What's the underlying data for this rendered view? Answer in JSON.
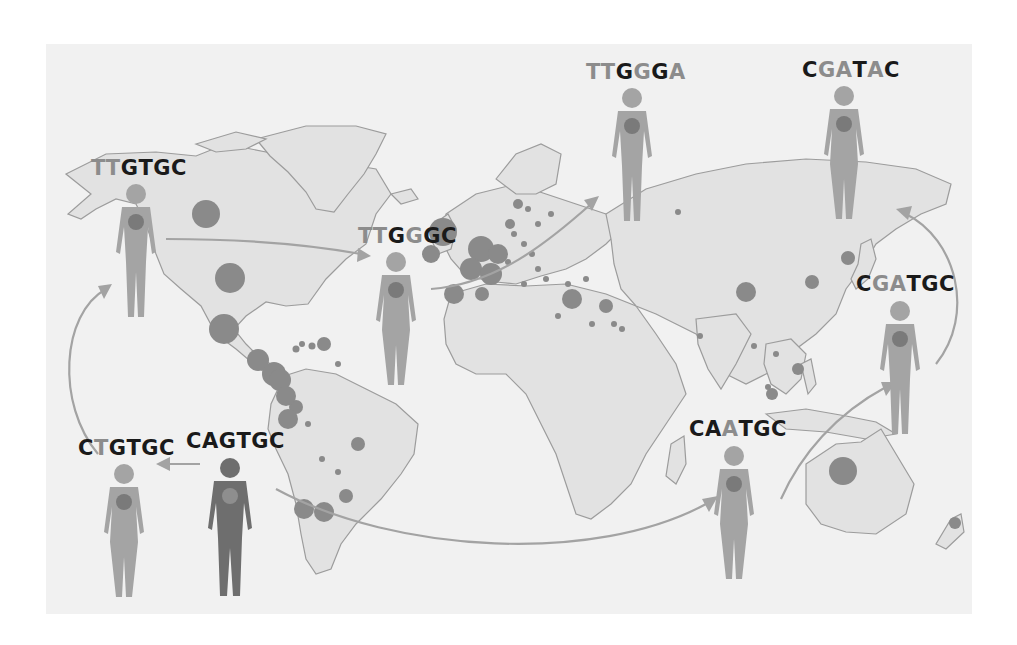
{
  "figure": {
    "title": "",
    "colors": {
      "background": "#f1f1f1",
      "land": "#e2e2e2",
      "land_border": "#9c9c9c",
      "case_dot": "#8a8a8a",
      "arrow": "#a3a3a3",
      "base_unchanged": "#1a1a1a",
      "base_mutated": "#8c8c8c",
      "person_origin": "#6e6e6e",
      "person_infected": "#a4a4a4"
    }
  },
  "people": [
    {
      "id": "origin",
      "sequence": "CAGTGC",
      "bases": [
        {
          "b": "C",
          "mutated": false
        },
        {
          "b": "A",
          "mutated": false
        },
        {
          "b": "G",
          "mutated": false
        },
        {
          "b": "T",
          "mutated": false
        },
        {
          "b": "G",
          "mutated": false
        },
        {
          "b": "C",
          "mutated": false
        }
      ],
      "figure": "male-dark",
      "region": "South America (south-west)"
    },
    {
      "id": "p1",
      "sequence": "CTGTGC",
      "bases": [
        {
          "b": "C",
          "mutated": false
        },
        {
          "b": "T",
          "mutated": true
        },
        {
          "b": "G",
          "mutated": false
        },
        {
          "b": "T",
          "mutated": false
        },
        {
          "b": "G",
          "mutated": false
        },
        {
          "b": "C",
          "mutated": false
        }
      ],
      "figure": "female",
      "region": "Pacific (west of South America)"
    },
    {
      "id": "p2",
      "sequence": "TTGTGC",
      "bases": [
        {
          "b": "T",
          "mutated": true
        },
        {
          "b": "T",
          "mutated": true
        },
        {
          "b": "G",
          "mutated": false
        },
        {
          "b": "T",
          "mutated": false
        },
        {
          "b": "G",
          "mutated": false
        },
        {
          "b": "C",
          "mutated": false
        }
      ],
      "figure": "male",
      "region": "North America (Alaska)"
    },
    {
      "id": "p3",
      "sequence": "TTGGGC",
      "bases": [
        {
          "b": "T",
          "mutated": true
        },
        {
          "b": "T",
          "mutated": true
        },
        {
          "b": "G",
          "mutated": false
        },
        {
          "b": "G",
          "mutated": true
        },
        {
          "b": "G",
          "mutated": false
        },
        {
          "b": "C",
          "mutated": false
        }
      ],
      "figure": "female",
      "region": "Atlantic (west of Europe)"
    },
    {
      "id": "p4",
      "sequence": "TTGGGA",
      "bases": [
        {
          "b": "T",
          "mutated": true
        },
        {
          "b": "T",
          "mutated": true
        },
        {
          "b": "G",
          "mutated": false
        },
        {
          "b": "G",
          "mutated": true
        },
        {
          "b": "G",
          "mutated": false
        },
        {
          "b": "A",
          "mutated": true
        }
      ],
      "figure": "male",
      "region": "Russia"
    },
    {
      "id": "p5",
      "sequence": "CAATGC",
      "bases": [
        {
          "b": "C",
          "mutated": false
        },
        {
          "b": "A",
          "mutated": false
        },
        {
          "b": "A",
          "mutated": true
        },
        {
          "b": "T",
          "mutated": false
        },
        {
          "b": "G",
          "mutated": false
        },
        {
          "b": "C",
          "mutated": false
        }
      ],
      "figure": "female",
      "region": "Indian Ocean"
    },
    {
      "id": "p6",
      "sequence": "CGATGC",
      "bases": [
        {
          "b": "C",
          "mutated": false
        },
        {
          "b": "G",
          "mutated": true
        },
        {
          "b": "A",
          "mutated": true
        },
        {
          "b": "T",
          "mutated": false
        },
        {
          "b": "G",
          "mutated": false
        },
        {
          "b": "C",
          "mutated": false
        }
      ],
      "figure": "male",
      "region": "Pacific (east of Asia)"
    },
    {
      "id": "p7",
      "sequence": "CGATAC",
      "bases": [
        {
          "b": "C",
          "mutated": false
        },
        {
          "b": "G",
          "mutated": true
        },
        {
          "b": "A",
          "mutated": true
        },
        {
          "b": "T",
          "mutated": false
        },
        {
          "b": "A",
          "mutated": true
        },
        {
          "b": "C",
          "mutated": false
        }
      ],
      "figure": "female",
      "region": "Siberia"
    }
  ],
  "transmissions": [
    {
      "from": "CAGTGC",
      "to": "CTGTGC"
    },
    {
      "from": "CTGTGC",
      "to": "TTGTGC"
    },
    {
      "from": "TTGTGC",
      "to": "TTGGGC"
    },
    {
      "from": "TTGGGC",
      "to": "TTGGGA"
    },
    {
      "from": "CAGTGC",
      "to": "CAATGC"
    },
    {
      "from": "CAATGC",
      "to": "CGATGC"
    },
    {
      "from": "CGATGC",
      "to": "CGATAC"
    }
  ],
  "case_clusters": [
    {
      "region": "Canada",
      "size": "large"
    },
    {
      "region": "United States",
      "size": "large"
    },
    {
      "region": "Mexico",
      "size": "large"
    },
    {
      "region": "Central America",
      "size": "large"
    },
    {
      "region": "Caribbean",
      "size": "small"
    },
    {
      "region": "Colombia",
      "size": "medium"
    },
    {
      "region": "Ecuador",
      "size": "large"
    },
    {
      "region": "Peru",
      "size": "large"
    },
    {
      "region": "Brazil",
      "size": "medium"
    },
    {
      "region": "Chile",
      "size": "large"
    },
    {
      "region": "Argentina",
      "size": "large"
    },
    {
      "region": "United Kingdom",
      "size": "large"
    },
    {
      "region": "France/Germany",
      "size": "large"
    },
    {
      "region": "Spain",
      "size": "large"
    },
    {
      "region": "Italy",
      "size": "medium"
    },
    {
      "region": "Scandinavia",
      "size": "medium"
    },
    {
      "region": "Eastern Europe",
      "size": "small"
    },
    {
      "region": "Russia",
      "size": "small"
    },
    {
      "region": "Turkey/Middle East",
      "size": "large"
    },
    {
      "region": "Iran",
      "size": "medium"
    },
    {
      "region": "Saudi Arabia",
      "size": "small"
    },
    {
      "region": "India",
      "size": "small"
    },
    {
      "region": "China",
      "size": "medium"
    },
    {
      "region": "Korea",
      "size": "medium"
    },
    {
      "region": "Japan",
      "size": "medium"
    },
    {
      "region": "Southeast Asia",
      "size": "medium"
    },
    {
      "region": "Philippines",
      "size": "medium"
    },
    {
      "region": "Australia",
      "size": "large"
    },
    {
      "region": "New Zealand",
      "size": "small"
    }
  ]
}
